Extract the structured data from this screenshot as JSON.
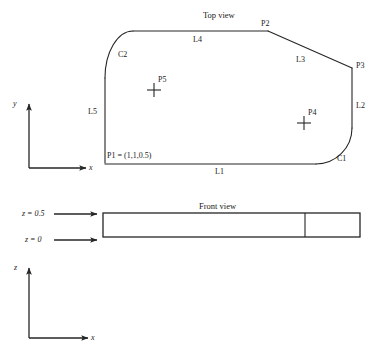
{
  "diagram": {
    "stroke_color": "#262626",
    "background_color": "#ffffff",
    "text_color": "#1a1a1a"
  },
  "top_view": {
    "title": "Top view",
    "point_labels": {
      "p1": "P1 = (1,1,0.5)",
      "p2": "P2",
      "p3": "P3",
      "p4": "P4",
      "p5": "P5"
    },
    "edge_labels": {
      "l1": "L1",
      "l2": "L2",
      "l3": "L3",
      "l4": "L4",
      "l5": "L5",
      "c1": "C1",
      "c2": "C2"
    }
  },
  "front_view": {
    "title": "Front view",
    "z_top_label": "z = 0.5",
    "z_bottom_label": "z = 0"
  },
  "axes": {
    "top": {
      "vertical": "y",
      "horizontal": "x"
    },
    "bottom": {
      "vertical": "z",
      "horizontal": "x"
    }
  }
}
